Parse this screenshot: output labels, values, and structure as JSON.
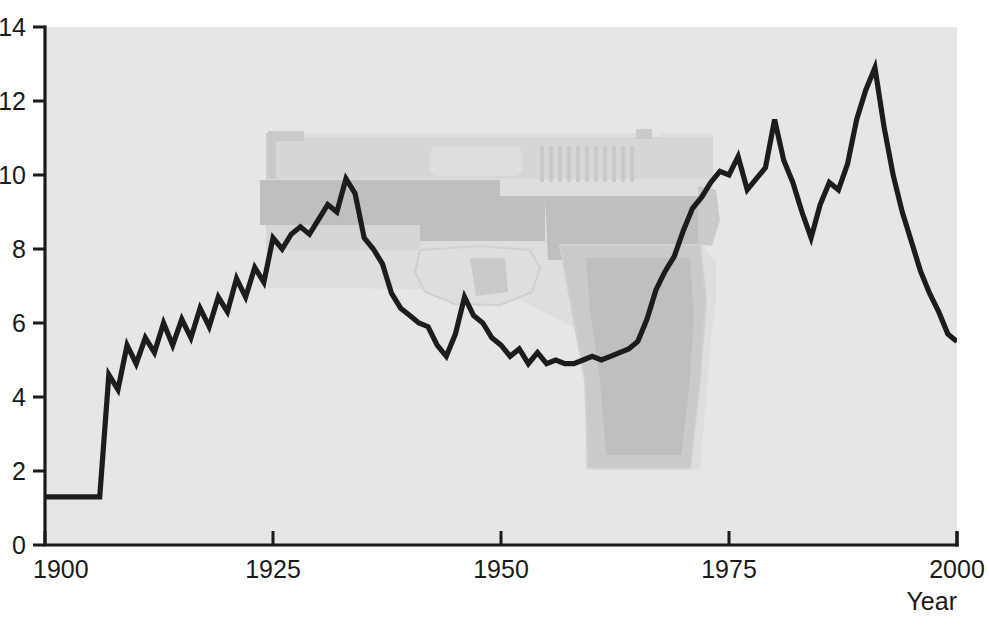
{
  "figure": {
    "background_color": "#ffffff",
    "plot_background_color": "#e6e6e6",
    "line_color": "#1c1c1c",
    "axis_color": "#1a1a1a",
    "watermark_name": "semi-automatic-pistol-watermark",
    "watermark_colors": [
      "#dedede",
      "#d6d6d6",
      "#cacaca",
      "#bfbfbf"
    ],
    "cropped_top_text": ""
  },
  "axes": {
    "x": {
      "title": "Year",
      "ticks": [
        "1900",
        "1925",
        "1950",
        "1975",
        "2000"
      ],
      "tick_values": [
        1900,
        1925,
        1950,
        1975,
        2000
      ],
      "min": 1900,
      "max": 2000
    },
    "y": {
      "title": "",
      "ticks": [
        "0",
        "2",
        "4",
        "6",
        "8",
        "10",
        "12",
        "14"
      ],
      "tick_values": [
        0,
        2,
        4,
        6,
        8,
        10,
        12,
        14
      ],
      "min": 0,
      "max": 14
    }
  },
  "chart_data": {
    "type": "line",
    "title": "",
    "subtitle": "",
    "xlabel": "Year",
    "ylabel": "",
    "xlim": [
      1900,
      2000
    ],
    "ylim": [
      0,
      14
    ],
    "grid": false,
    "legend": null,
    "annotations": [],
    "series": [
      {
        "name": "Homicide rate",
        "color": "#1c1c1c",
        "x": [
          1900,
          1901,
          1902,
          1903,
          1904,
          1905,
          1906,
          1907,
          1908,
          1909,
          1910,
          1911,
          1912,
          1913,
          1914,
          1915,
          1916,
          1917,
          1918,
          1919,
          1920,
          1921,
          1922,
          1923,
          1924,
          1925,
          1926,
          1927,
          1928,
          1929,
          1930,
          1931,
          1932,
          1933,
          1934,
          1935,
          1936,
          1937,
          1938,
          1939,
          1940,
          1941,
          1942,
          1943,
          1944,
          1945,
          1946,
          1947,
          1948,
          1949,
          1950,
          1951,
          1952,
          1953,
          1954,
          1955,
          1956,
          1957,
          1958,
          1959,
          1960,
          1961,
          1962,
          1963,
          1964,
          1965,
          1966,
          1967,
          1968,
          1969,
          1970,
          1971,
          1972,
          1973,
          1974,
          1975,
          1976,
          1977,
          1978,
          1979,
          1980,
          1981,
          1982,
          1983,
          1984,
          1985,
          1986,
          1987,
          1988,
          1989,
          1990,
          1991,
          1992,
          1993,
          1994,
          1995,
          1996,
          1997,
          1998,
          1999,
          2000
        ],
        "y": [
          1.3,
          1.3,
          1.3,
          1.3,
          1.3,
          1.3,
          1.3,
          4.6,
          4.2,
          5.4,
          4.9,
          5.6,
          5.2,
          6.0,
          5.4,
          6.1,
          5.6,
          6.4,
          5.9,
          6.7,
          6.3,
          7.2,
          6.7,
          7.5,
          7.1,
          8.3,
          8.0,
          8.4,
          8.6,
          8.4,
          8.8,
          9.2,
          9.0,
          9.9,
          9.5,
          8.3,
          8.0,
          7.6,
          6.8,
          6.4,
          6.2,
          6.0,
          5.9,
          5.4,
          5.1,
          5.7,
          6.7,
          6.2,
          6.0,
          5.6,
          5.4,
          5.1,
          5.3,
          4.9,
          5.2,
          4.9,
          5.0,
          4.9,
          4.9,
          5.0,
          5.1,
          5.0,
          5.1,
          5.2,
          5.3,
          5.5,
          6.1,
          6.9,
          7.4,
          7.8,
          8.5,
          9.1,
          9.4,
          9.8,
          10.1,
          10.0,
          10.5,
          9.6,
          9.9,
          10.2,
          11.5,
          10.4,
          9.8,
          9.0,
          8.3,
          9.2,
          9.8,
          9.6,
          10.3,
          11.5,
          12.3,
          12.9,
          11.3,
          10.0,
          9.0,
          8.2,
          7.4,
          6.8,
          6.3,
          5.7,
          5.5
        ]
      }
    ]
  }
}
